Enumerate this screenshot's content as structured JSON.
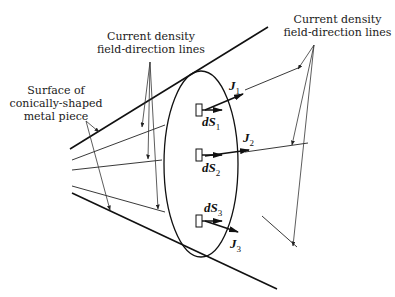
{
  "diagram": {
    "labels": {
      "current_density_left": [
        "Current density",
        "field-direction lines"
      ],
      "current_density_right": [
        "Current density",
        "field-direction lines"
      ],
      "surface": [
        "Surface of",
        "conically-shaped",
        "metal piece"
      ]
    },
    "vectors": [
      {
        "name": "J",
        "sub": "1"
      },
      {
        "name": "J",
        "sub": "2"
      },
      {
        "name": "J",
        "sub": "3"
      }
    ],
    "surface_elements": [
      {
        "name": "dS",
        "sub": "1"
      },
      {
        "name": "dS",
        "sub": "2"
      },
      {
        "name": "dS",
        "sub": "3"
      }
    ],
    "colors": {
      "ink": "#1a1a1a",
      "background": "#ffffff"
    }
  }
}
